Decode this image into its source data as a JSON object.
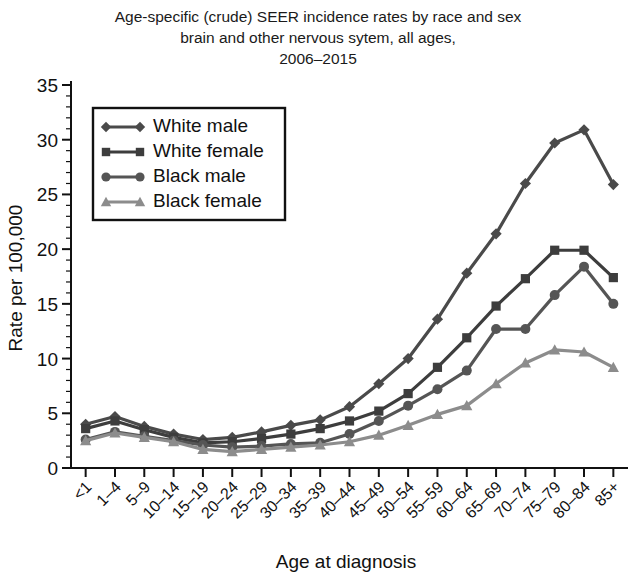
{
  "title": {
    "line1": "Age-specific (crude) SEER incidence rates by race and sex",
    "line2": "brain and other nervous sytem, all ages,",
    "line3": "2006–2015"
  },
  "chart_data": {
    "type": "line",
    "title": "Age-specific (crude) SEER incidence rates by race and sex brain and other nervous sytem, all ages, 2006–2015",
    "xlabel": "Age at diagnosis",
    "ylabel": "Rate per 100,000",
    "ylim": [
      0,
      35
    ],
    "ytick_values": [
      0,
      5,
      10,
      15,
      20,
      25,
      30,
      35
    ],
    "ytick_labels": [
      "0",
      "5",
      "10",
      "15",
      "20",
      "25",
      "30",
      "35"
    ],
    "y_minor_step": 1,
    "grid": false,
    "legend_position": "upper-left",
    "categories": [
      "<1",
      "1–4",
      "5–9",
      "10–14",
      "15–19",
      "20–24",
      "25–29",
      "30–34",
      "35–39",
      "40–44",
      "45–49",
      "50–54",
      "55–59",
      "60–64",
      "65–69",
      "70–74",
      "75–79",
      "80–84",
      "85+"
    ],
    "series": [
      {
        "name": "White male",
        "marker": "diamond",
        "color": "#4a4a4a",
        "values": [
          4.0,
          4.7,
          3.8,
          3.1,
          2.6,
          2.8,
          3.3,
          3.9,
          4.4,
          5.6,
          7.7,
          10.0,
          13.6,
          17.8,
          21.4,
          26.0,
          29.7,
          30.9,
          25.9
        ]
      },
      {
        "name": "White female",
        "marker": "square",
        "color": "#3d3d3d",
        "values": [
          3.6,
          4.3,
          3.5,
          2.8,
          2.3,
          2.4,
          2.7,
          3.1,
          3.6,
          4.3,
          5.2,
          6.8,
          9.2,
          11.9,
          14.8,
          17.3,
          19.9,
          19.9,
          17.4
        ]
      },
      {
        "name": "Black male",
        "marker": "circle",
        "color": "#555555",
        "values": [
          2.6,
          3.3,
          2.9,
          2.5,
          2.1,
          1.9,
          2.0,
          2.2,
          2.3,
          3.1,
          4.3,
          5.7,
          7.2,
          8.9,
          12.7,
          12.7,
          15.8,
          18.4,
          15.0
        ]
      },
      {
        "name": "Black female",
        "marker": "triangle",
        "color": "#8c8c8c",
        "values": [
          2.5,
          3.2,
          2.8,
          2.4,
          1.7,
          1.5,
          1.7,
          1.9,
          2.1,
          2.4,
          3.0,
          3.9,
          4.9,
          5.7,
          7.7,
          9.6,
          10.8,
          10.6,
          9.2
        ]
      }
    ]
  },
  "legend": {
    "items": [
      {
        "label": "White male"
      },
      {
        "label": "White female"
      },
      {
        "label": "Black male"
      },
      {
        "label": "Black female"
      }
    ]
  }
}
